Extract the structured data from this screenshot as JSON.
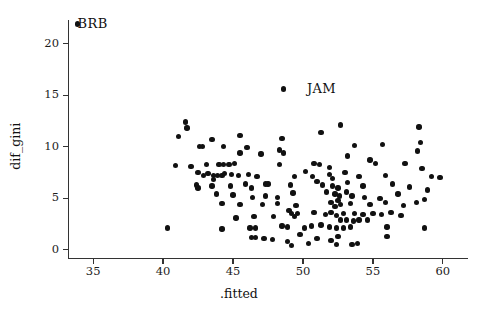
{
  "chart_data": {
    "type": "scatter",
    "title": "",
    "xlabel": ".fitted",
    "ylabel": "dif_gini",
    "xlim": [
      33.2,
      61.8
    ],
    "ylim": [
      -0.8,
      22.3
    ],
    "xticks": [
      35,
      40,
      45,
      50,
      55,
      60
    ],
    "yticks": [
      0,
      5,
      10,
      15,
      20
    ],
    "xtick_labels": [
      "35",
      "40",
      "45",
      "50",
      "55",
      "60"
    ],
    "ytick_labels": [
      "0",
      "5",
      "10",
      "15",
      "20"
    ],
    "grid": false,
    "legend": null,
    "marker": {
      "shape": "circle",
      "color": "#111111",
      "size": 5.4
    },
    "annotations": [
      {
        "text": "BRB",
        "x": 33.6,
        "y": 21.9,
        "anchor": "left"
      },
      {
        "text": "JAM",
        "x": 50.0,
        "y": 15.6,
        "anchor": "left"
      }
    ],
    "points": [
      [
        33.9,
        21.9
      ],
      [
        48.6,
        15.6
      ],
      [
        41.6,
        12.4
      ],
      [
        41.7,
        11.8
      ],
      [
        41.1,
        11.0
      ],
      [
        43.5,
        10.7
      ],
      [
        45.5,
        11.1
      ],
      [
        42.6,
        10.0
      ],
      [
        42.8,
        10.0
      ],
      [
        44.3,
        10.0
      ],
      [
        45.5,
        9.4
      ],
      [
        48.5,
        10.8
      ],
      [
        48.3,
        9.7
      ],
      [
        48.6,
        9.4
      ],
      [
        51.3,
        11.4
      ],
      [
        52.7,
        12.1
      ],
      [
        53.7,
        10.1
      ],
      [
        55.7,
        10.2
      ],
      [
        58.3,
        11.9
      ],
      [
        58.4,
        10.4
      ],
      [
        58.2,
        9.6
      ],
      [
        40.9,
        8.2
      ],
      [
        42.0,
        8.1
      ],
      [
        43.1,
        8.3
      ],
      [
        44.0,
        8.3
      ],
      [
        44.3,
        8.3
      ],
      [
        44.7,
        8.3
      ],
      [
        45.1,
        8.4
      ],
      [
        48.3,
        8.3
      ],
      [
        50.8,
        8.4
      ],
      [
        51.2,
        8.3
      ],
      [
        51.9,
        8.0
      ],
      [
        55.2,
        8.4
      ],
      [
        57.3,
        8.4
      ],
      [
        58.5,
        7.9
      ],
      [
        42.5,
        7.5
      ],
      [
        42.9,
        7.2
      ],
      [
        43.2,
        7.4
      ],
      [
        43.6,
        7.2
      ],
      [
        43.9,
        7.2
      ],
      [
        44.2,
        7.2
      ],
      [
        44.4,
        7.4
      ],
      [
        44.9,
        7.3
      ],
      [
        45.4,
        7.2
      ],
      [
        46.1,
        7.3
      ],
      [
        46.7,
        7.1
      ],
      [
        49.4,
        7.1
      ],
      [
        50.7,
        7.1
      ],
      [
        51.9,
        7.3
      ],
      [
        52.1,
        6.9
      ],
      [
        53.0,
        7.5
      ],
      [
        54.0,
        7.1
      ],
      [
        55.9,
        7.2
      ],
      [
        59.2,
        7.1
      ],
      [
        59.8,
        7.0
      ],
      [
        42.4,
        6.3
      ],
      [
        42.5,
        6.0
      ],
      [
        43.5,
        6.2
      ],
      [
        44.8,
        6.2
      ],
      [
        45.9,
        6.4
      ],
      [
        46.3,
        6.0
      ],
      [
        47.3,
        6.4
      ],
      [
        47.5,
        6.4
      ],
      [
        49.1,
        6.3
      ],
      [
        51.4,
        6.3
      ],
      [
        52.1,
        6.2
      ],
      [
        52.5,
        6.0
      ],
      [
        53.2,
        6.5
      ],
      [
        54.3,
        6.2
      ],
      [
        56.4,
        6.4
      ],
      [
        57.6,
        6.1
      ],
      [
        58.9,
        5.8
      ],
      [
        43.8,
        5.4
      ],
      [
        45.0,
        5.3
      ],
      [
        46.4,
        5.1
      ],
      [
        47.3,
        5.2
      ],
      [
        48.2,
        5.1
      ],
      [
        49.3,
        5.5
      ],
      [
        51.7,
        5.6
      ],
      [
        52.3,
        5.4
      ],
      [
        52.6,
        5.2
      ],
      [
        53.1,
        5.6
      ],
      [
        53.5,
        5.2
      ],
      [
        54.4,
        5.1
      ],
      [
        55.5,
        5.0
      ],
      [
        56.8,
        5.4
      ],
      [
        58.7,
        4.9
      ],
      [
        44.2,
        4.5
      ],
      [
        45.5,
        4.4
      ],
      [
        47.1,
        4.4
      ],
      [
        48.2,
        4.5
      ],
      [
        49.5,
        4.3
      ],
      [
        52.0,
        4.6
      ],
      [
        52.3,
        4.2
      ],
      [
        52.5,
        4.8
      ],
      [
        52.7,
        4.4
      ],
      [
        53.4,
        4.5
      ],
      [
        54.8,
        4.4
      ],
      [
        55.9,
        4.6
      ],
      [
        57.2,
        4.3
      ],
      [
        58.1,
        4.6
      ],
      [
        49.0,
        3.8
      ],
      [
        49.2,
        3.5
      ],
      [
        49.4,
        3.2
      ],
      [
        49.6,
        3.5
      ],
      [
        50.8,
        3.6
      ],
      [
        51.6,
        3.4
      ],
      [
        52.0,
        3.6
      ],
      [
        52.4,
        3.3
      ],
      [
        52.9,
        3.5
      ],
      [
        53.7,
        3.5
      ],
      [
        54.3,
        3.4
      ],
      [
        55.0,
        3.5
      ],
      [
        55.6,
        3.4
      ],
      [
        56.3,
        3.6
      ],
      [
        57.0,
        3.3
      ],
      [
        45.2,
        3.1
      ],
      [
        46.5,
        3.2
      ],
      [
        47.9,
        3.2
      ],
      [
        52.7,
        2.9
      ],
      [
        53.1,
        2.9
      ],
      [
        53.6,
        2.8
      ],
      [
        54.0,
        2.9
      ],
      [
        54.6,
        2.9
      ],
      [
        40.3,
        2.1
      ],
      [
        44.2,
        2.0
      ],
      [
        46.2,
        2.1
      ],
      [
        46.6,
        2.1
      ],
      [
        48.5,
        2.3
      ],
      [
        48.9,
        2.2
      ],
      [
        50.1,
        2.1
      ],
      [
        50.6,
        2.3
      ],
      [
        51.3,
        2.4
      ],
      [
        51.9,
        2.2
      ],
      [
        52.4,
        2.1
      ],
      [
        52.9,
        2.1
      ],
      [
        53.4,
        2.2
      ],
      [
        56.0,
        2.2
      ],
      [
        58.7,
        2.1
      ],
      [
        46.3,
        1.2
      ],
      [
        46.6,
        1.2
      ],
      [
        49.8,
        1.5
      ],
      [
        52.5,
        1.3
      ],
      [
        47.8,
        1.0
      ],
      [
        48.9,
        0.8
      ],
      [
        50.4,
        0.6
      ],
      [
        52.4,
        0.5
      ],
      [
        52.0,
        0.9
      ],
      [
        53.5,
        0.5
      ],
      [
        53.9,
        0.6
      ],
      [
        51.0,
        1.1
      ],
      [
        47.2,
        1.1
      ],
      [
        49.2,
        0.4
      ],
      [
        43.6,
        6.8
      ],
      [
        46.0,
        9.9
      ],
      [
        47.0,
        9.3
      ],
      [
        53.2,
        9.1
      ],
      [
        54.8,
        8.7
      ],
      [
        50.2,
        7.6
      ],
      [
        51.0,
        6.6
      ],
      [
        56.0,
        1.3
      ]
    ]
  }
}
